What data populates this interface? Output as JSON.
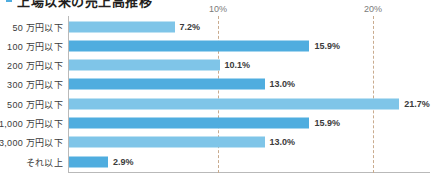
{
  "title": {
    "text": "上場以来の売上高推移",
    "marker_color": "#4FADDF"
  },
  "chart_data": {
    "type": "bar",
    "orientation": "horizontal",
    "title": "",
    "xlabel": "",
    "ylabel": "",
    "categories": [
      "50 万円以下",
      "100 万円以下",
      "200 万円以下",
      "300 万円以下",
      "500 万円以下",
      "1,000 万円以下",
      "3,000 万円以下",
      "それ以上"
    ],
    "values": [
      7.2,
      15.9,
      10.1,
      13.0,
      21.7,
      15.9,
      13.0,
      2.9
    ],
    "value_labels": [
      "7.2%",
      "15.9%",
      "10.1%",
      "13.0%",
      "21.7%",
      "15.9%",
      "13.0%",
      "2.9%"
    ],
    "bar_colors": [
      "#7FC5E8",
      "#4FADDF",
      "#7FC5E8",
      "#4FADDF",
      "#7FC5E8",
      "#4FADDF",
      "#7FC5E8",
      "#4FADDF"
    ],
    "xlim": [
      0,
      23.7
    ],
    "gridlines": [
      {
        "value": 10,
        "label": "10%"
      },
      {
        "value": 20,
        "label": "20%"
      }
    ],
    "grid": true,
    "legend": "none",
    "axis_color": "#b9b9b9",
    "gridline_color": "#c9ab8e"
  }
}
